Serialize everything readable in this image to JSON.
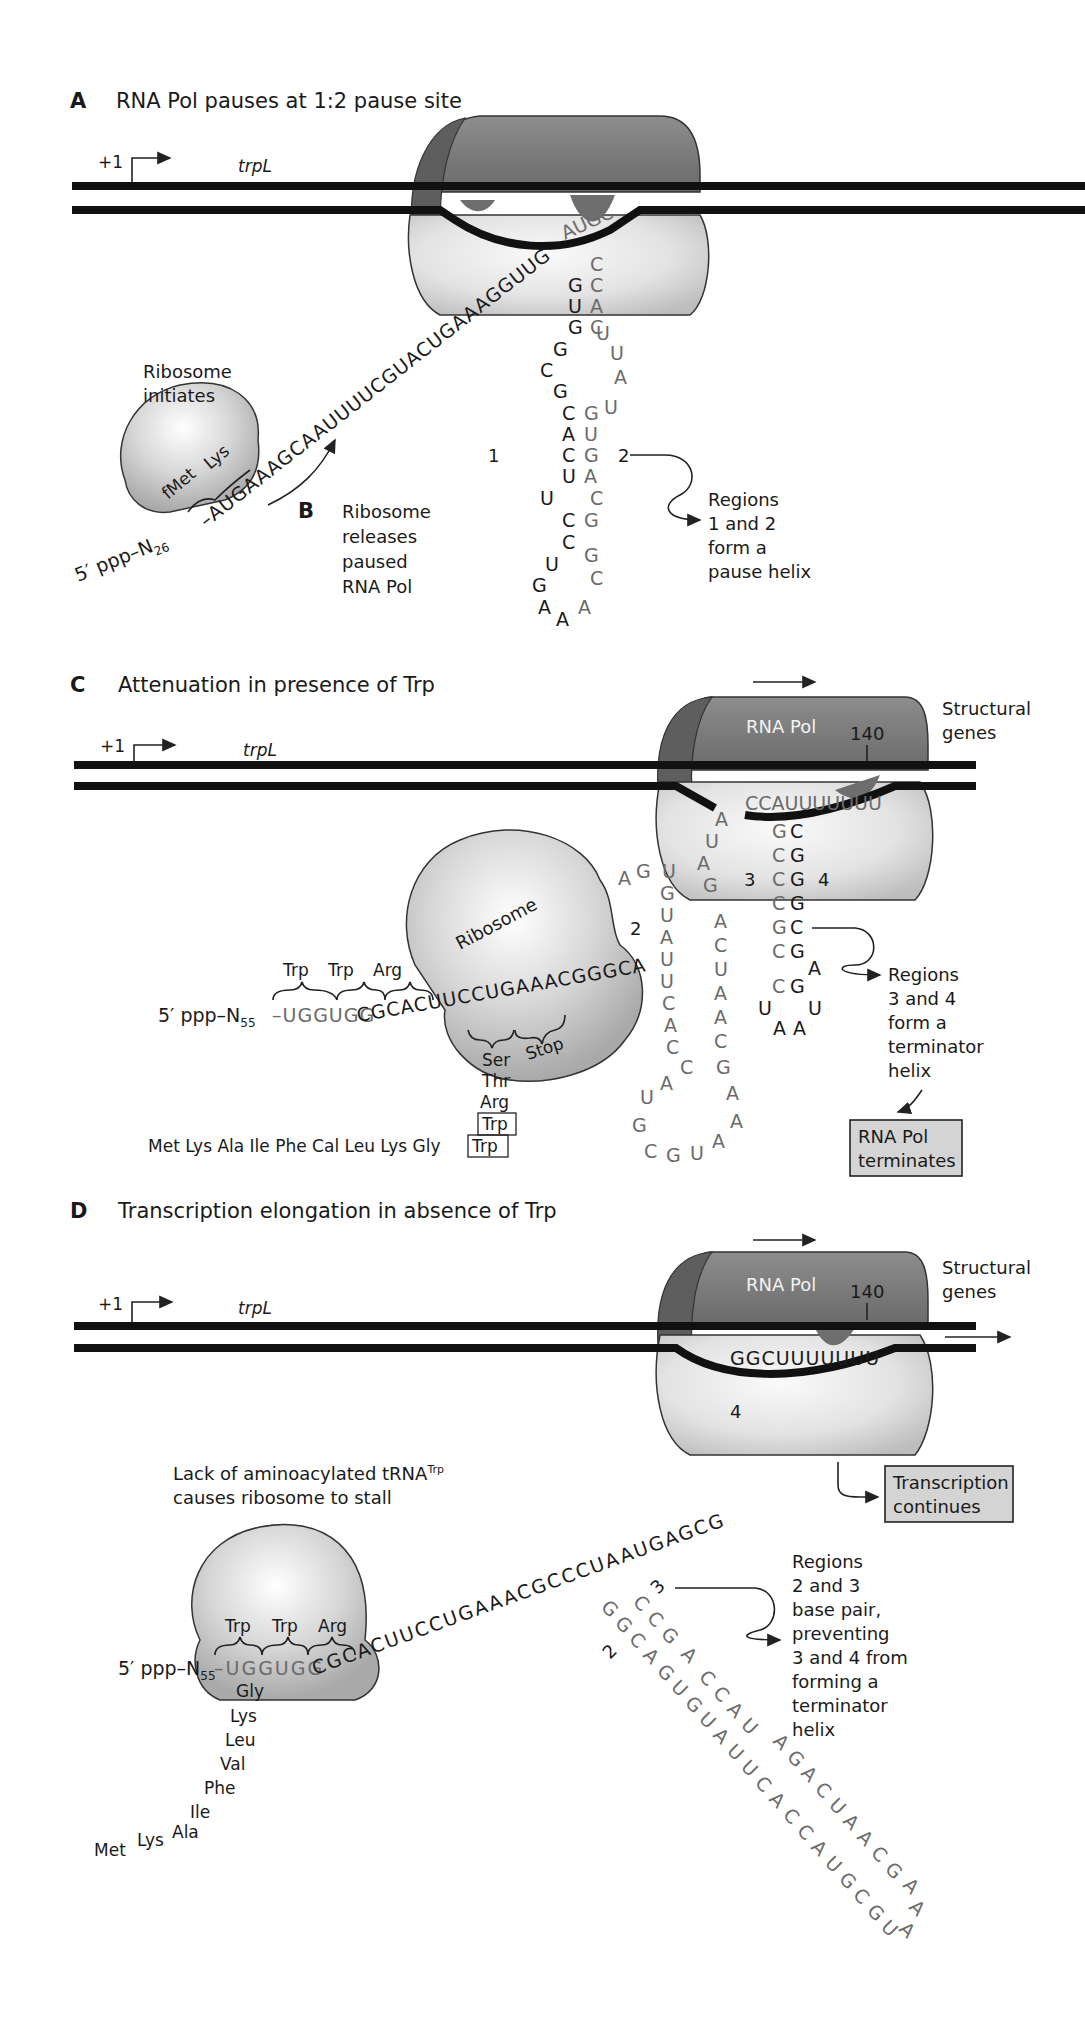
{
  "panels": {
    "A": {
      "letter": "A",
      "title": "RNA Pol pauses at 1:2 pause site",
      "promoter_label": "+1",
      "gene_label": "trpL",
      "ribosome_label_line1": "Ribosome",
      "ribosome_label_line2": "initiates",
      "codon_fMet": "fMet",
      "codon_Lys": "Lys",
      "five_prime": "5′ ppp–N",
      "five_prime_sub": "26",
      "leader_seq": "–AUGAAAGCAAUUUUCGUACUGAAAGGUUG",
      "pol_loop_seq": "AUGC",
      "stem_left": [
        "G",
        "U",
        "G",
        "G",
        "C",
        "G",
        "C",
        "A",
        "C",
        "U",
        "U",
        "C",
        "C",
        "U",
        "G",
        "A"
      ],
      "stem_right": [
        "C",
        "C",
        "A",
        "C",
        "U",
        "U",
        "A",
        "U",
        "G",
        "U",
        "G",
        "A",
        "C",
        "G",
        "G",
        "G",
        "C",
        "A"
      ],
      "region1": "1",
      "region2": "2",
      "note_line1": "Regions",
      "note_line2": "1 and 2",
      "note_line3": "form a",
      "note_line4": "pause helix"
    },
    "B": {
      "letter": "B",
      "line1": "Ribosome",
      "line2": "releases",
      "line3": "paused",
      "line4": "RNA Pol"
    },
    "C": {
      "letter": "C",
      "title": "Attenuation in presence of Trp",
      "promoter_label": "+1",
      "gene_label": "trpL",
      "pol_label": "RNA Pol",
      "position": "140",
      "structural_line1": "Structural",
      "structural_line2": "genes",
      "ribosome_label": "Ribosome",
      "codons": [
        "Trp",
        "Trp",
        "Arg"
      ],
      "five_prime": "5′ ppp–N",
      "five_prime_sub": "55",
      "seq_grey": "–UGGUGG",
      "seq_dark": "CGCACUUCCUGAAACGGGCA",
      "ser": "Ser",
      "stop": "Stop",
      "thr": "Thr",
      "arg": "Arg",
      "trp_box": "Trp",
      "peptide": "Met Lys Ala Ile Phe Cal Leu Lys Gly",
      "peptide_trp": "Trp",
      "region2": "2",
      "region3": "3",
      "region4": "4",
      "pol_seq": "CCAUUUUUUU",
      "note_line1": "Regions",
      "note_line2": "3 and 4",
      "note_line3": "form a",
      "note_line4": "terminator",
      "note_line5": "helix",
      "terminates_line1": "RNA Pol",
      "terminates_line2": "terminates"
    },
    "D": {
      "letter": "D",
      "title": "Transcription elongation in absence of Trp",
      "promoter_label": "+1",
      "gene_label": "trpL",
      "pol_label": "RNA Pol",
      "position": "140",
      "structural_line1": "Structural",
      "structural_line2": "genes",
      "pol_seq": "GGCUUUUUUU",
      "stall_line1": "Lack of aminoacylated tRNA",
      "stall_sup": "Trp",
      "stall_line2": "causes ribosome to stall",
      "codons": [
        "Trp",
        "Trp",
        "Arg"
      ],
      "five_prime": "5′ ppp–N",
      "five_prime_sub": "55",
      "seq_grey": "–UGGUGG",
      "seq_dark": "CGCACUUCCUGAAACGCCCUAAUGAGCG",
      "peptide_chain": [
        "Gly",
        "Lys",
        "Leu",
        "Val",
        "Phe",
        "Ile",
        "Ala",
        "Lys",
        "Met"
      ],
      "region2": "2",
      "region3": "3",
      "region4": "4",
      "continues_line1": "Transcription",
      "continues_line2": "continues",
      "note_line1": "Regions",
      "note_line2": "2 and 3",
      "note_line3": "base pair,",
      "note_line4": "preventing",
      "note_line5": "3 and 4 from",
      "note_line6": "forming a",
      "note_line7": "terminator",
      "note_line8": "helix"
    }
  },
  "colors": {
    "rna_pol_dark": "#6e6e6e",
    "rna_pol_mid": "#8a8a8a",
    "pol_body_light": "#e2e2e2",
    "ribosome": "#cfcfcf",
    "nucleotide_grey": "#6b6b6b",
    "box_fill": "#d4d4d4"
  }
}
